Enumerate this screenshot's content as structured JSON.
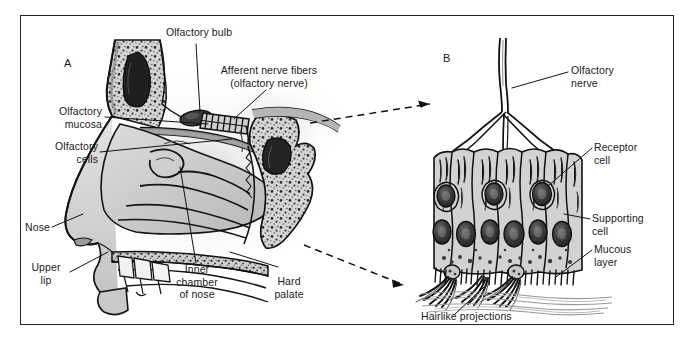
{
  "figure": {
    "type": "anatomical-diagram",
    "panels": [
      {
        "id": "A",
        "letter": "A",
        "caption": "Sagittal section of the nasal cavity"
      },
      {
        "id": "B",
        "letter": "B",
        "caption": "Magnified olfactory mucosa"
      }
    ]
  },
  "labels": {
    "panel_a": [
      {
        "name": "olfactory-bulb",
        "text": "Olfactory bulb"
      },
      {
        "name": "afferent-nerve-fibers",
        "text": "Afferent nerve fibers\n(olfactory nerve)"
      },
      {
        "name": "olfactory-mucosa",
        "text": "Olfactory\nmucosa"
      },
      {
        "name": "olfactory-cells",
        "text": "Olfactory\ncells"
      },
      {
        "name": "nose",
        "text": "Nose"
      },
      {
        "name": "upper-lip",
        "text": "Upper\nlip"
      },
      {
        "name": "inner-chamber-of-nose",
        "text": "Inner\nchamber\nof nose"
      },
      {
        "name": "hard-palate",
        "text": "Hard\npalate"
      }
    ],
    "panel_b": [
      {
        "name": "olfactory-nerve",
        "text": "Olfactory\nnerve"
      },
      {
        "name": "receptor-cell",
        "text": "Receptor\ncell"
      },
      {
        "name": "supporting-cell",
        "text": "Supporting\ncell"
      },
      {
        "name": "mucous-layer",
        "text": "Mucous\nlayer"
      },
      {
        "name": "hairlike-projections",
        "text": "Hairlike projections"
      }
    ]
  },
  "colors": {
    "frame_border": "#222222",
    "background": "#ffffff",
    "ink": "#1a1a1a",
    "tissue_light": "#d9d9d9",
    "tissue_mid": "#bdbdbd",
    "tissue_dark": "#8f8f8f",
    "nucleus_dark": "#2e2e2e",
    "leader_line": "#111111"
  }
}
